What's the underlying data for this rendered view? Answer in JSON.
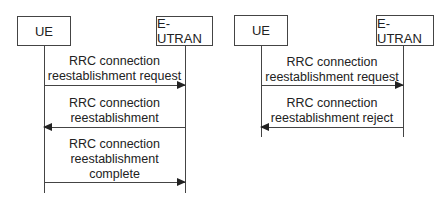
{
  "diagrams": [
    {
      "name": "successful",
      "participants": {
        "ue": "UE",
        "enb": "E-UTRAN"
      },
      "messages": [
        {
          "label": "RRC connection\nreestablishment request",
          "direction": "ue-to-eutran"
        },
        {
          "label": "RRC connection\nreestablishment",
          "direction": "eutran-to-ue"
        },
        {
          "label": "RRC connection\nreestablishment\ncomplete",
          "direction": "ue-to-eutran"
        }
      ]
    },
    {
      "name": "rejected",
      "participants": {
        "ue": "UE",
        "enb": "E-UTRAN"
      },
      "messages": [
        {
          "label": "RRC connection\nreestablishment request",
          "direction": "ue-to-eutran"
        },
        {
          "label": "RRC connection\nreestablishment reject",
          "direction": "eutran-to-ue"
        }
      ]
    }
  ]
}
